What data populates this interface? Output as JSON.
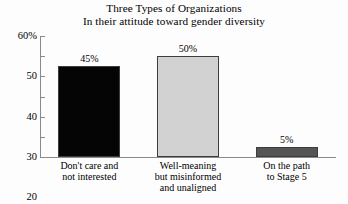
{
  "chart_data": {
    "type": "bar",
    "title": "Three Types of Organizations",
    "subtitle": "In their attitude toward gender diversity",
    "xlabel": "",
    "ylabel": "",
    "ylim": [
      0,
      60
    ],
    "grid": false,
    "legend": false,
    "y_ticks": [
      "60%",
      "50",
      "40",
      "30",
      "20",
      "10",
      "0"
    ],
    "y_tick_values": [
      60,
      50,
      40,
      30,
      20,
      10,
      0
    ],
    "categories": [
      [
        "Don't care and",
        "not interested"
      ],
      [
        "Well-meaning",
        "but misinformed",
        "and unaligned"
      ],
      [
        "On the path",
        "to Stage 5"
      ]
    ],
    "values": [
      45,
      50,
      5
    ],
    "value_labels": [
      "45%",
      "50%",
      "5%"
    ],
    "bar_colors": [
      "#050505",
      "#d2d2d2",
      "#555555"
    ],
    "bar_border_color": "#3d3d3d",
    "axis_color": "#8a8a8a",
    "background": "#fdfdfd"
  }
}
